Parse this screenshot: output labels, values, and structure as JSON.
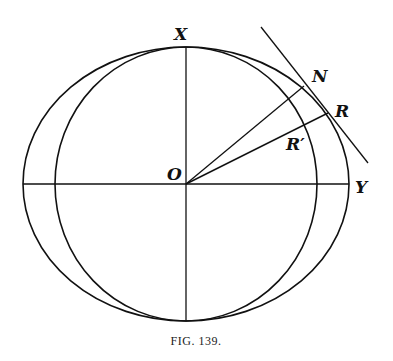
{
  "figure": {
    "caption": "Fig. 139.",
    "caption_small_caps": "FIG. 139.",
    "top_text_fragment": "by an equiv... "
  },
  "labels": {
    "x": "X",
    "y": "Y",
    "o": "O",
    "n": "N",
    "r": "R",
    "r_prime": "R′"
  },
  "geometry": {
    "center": [
      186,
      184
    ],
    "circle_radius": 134,
    "ellipse_rx": 163,
    "ellipse_ry": 134,
    "point_N": [
      303,
      86
    ],
    "point_R": [
      328,
      113
    ],
    "point_R_prime": [
      299,
      126
    ],
    "tangent_line": [
      [
        261,
        27
      ],
      [
        368,
        163
      ]
    ],
    "stroke_color": "#111111"
  }
}
